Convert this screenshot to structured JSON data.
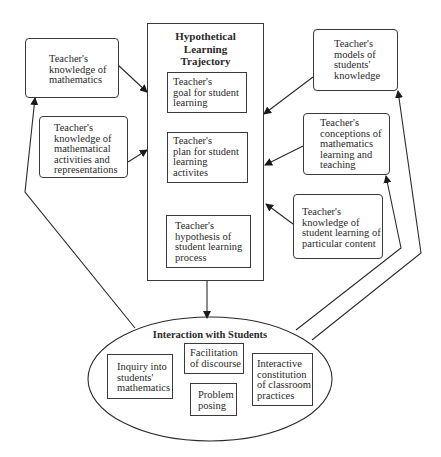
{
  "diagram": {
    "center": {
      "title": "Hypothetical\nLearning\nTrajectory",
      "boxes": [
        {
          "id": "goal",
          "label": "Teacher's\ngoal for student\nlearning"
        },
        {
          "id": "plan",
          "label": "Teacher's\nplan for student\nlearning\nactivites"
        },
        {
          "id": "hypothesis",
          "label": "Teacher's\nhypothesis of\nstudent learning\nprocess"
        }
      ]
    },
    "left_inputs": [
      {
        "id": "knowledge-math",
        "label": "Teacher's\nknowledge of\nmathematics"
      },
      {
        "id": "knowledge-activities",
        "label": "Teacher's\nknowledge of\nmathematical\nactivities and\nrepresentations"
      }
    ],
    "right_inputs": [
      {
        "id": "models-students",
        "label": "Teacher's\nmodels of\nstudents'\nknowledge"
      },
      {
        "id": "conceptions",
        "label": "Teacher's\nconceptions of\nmathematics\nlearning and\nteaching"
      },
      {
        "id": "knowledge-student-learning",
        "label": "Teacher's\nknowledge of\nstudent learning of\nparticular content"
      }
    ],
    "interaction": {
      "title": "Interaction with Students",
      "boxes": [
        {
          "id": "inquiry",
          "label": "Inquiry into\nstudents'\nmathematics"
        },
        {
          "id": "facilitation",
          "label": "Facilitation\nof discourse"
        },
        {
          "id": "problem",
          "label": "Problem\nposing"
        },
        {
          "id": "interactive",
          "label": "Interactive\nconstitution\nof classroom\npractices"
        }
      ]
    },
    "connections": [
      {
        "from": "knowledge-math",
        "to": "Hypothetical Learning Trajectory"
      },
      {
        "from": "knowledge-activities",
        "to": "Hypothetical Learning Trajectory"
      },
      {
        "from": "models-students",
        "to": "Hypothetical Learning Trajectory"
      },
      {
        "from": "conceptions",
        "to": "Hypothetical Learning Trajectory"
      },
      {
        "from": "knowledge-student-learning",
        "to": "Hypothetical Learning Trajectory"
      },
      {
        "from": "goal",
        "to": "plan"
      },
      {
        "from": "plan",
        "to": "hypothesis",
        "bidirectional": true
      },
      {
        "from": "Hypothetical Learning Trajectory",
        "to": "Interaction with Students"
      },
      {
        "from": "Interaction with Students",
        "to": "knowledge-math"
      },
      {
        "from": "Interaction with Students",
        "to": "conceptions"
      },
      {
        "from": "Interaction with Students",
        "to": "models-students"
      }
    ],
    "colors": {
      "line": "#2a2a2a",
      "background": "#ffffff"
    }
  }
}
